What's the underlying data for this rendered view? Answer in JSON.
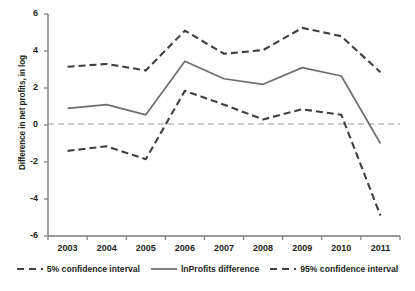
{
  "chart_data": {
    "type": "line",
    "title": "",
    "xlabel": "",
    "ylabel": "Difference in net profits, in log",
    "categories": [
      "2003",
      "2004",
      "2005",
      "2006",
      "2007",
      "2008",
      "2009",
      "2010",
      "2011"
    ],
    "x": [
      2003,
      2004,
      2005,
      2006,
      2007,
      2008,
      2009,
      2010,
      2011
    ],
    "ylim": [
      -6,
      6
    ],
    "yticks": [
      6,
      4,
      2,
      0,
      -2,
      -4,
      -6
    ],
    "ytick_labels": [
      "6",
      "4",
      "2",
      "0",
      "-2",
      "-4",
      "-6"
    ],
    "grid": false,
    "zero_line": 0,
    "legend_position": "bottom",
    "series": [
      {
        "name": "5% confidence interval",
        "style": "dashed",
        "color": "#3f3f3f",
        "values": [
          3.15,
          3.3,
          2.95,
          5.1,
          3.85,
          4.05,
          5.25,
          4.8,
          2.85
        ]
      },
      {
        "name": "lnProfits difference",
        "style": "solid",
        "color": "#6e6e6e",
        "values": [
          0.9,
          1.1,
          0.55,
          3.45,
          2.5,
          2.2,
          3.1,
          2.65,
          -1.0
        ]
      },
      {
        "name": "95% confidence interval",
        "style": "dashed",
        "color": "#3f3f3f",
        "values": [
          -1.4,
          -1.15,
          -1.85,
          1.85,
          1.1,
          0.3,
          0.85,
          0.55,
          -4.9
        ]
      }
    ]
  },
  "axis": {
    "y_title": "Difference in net profits, in log"
  },
  "legend": {
    "items": [
      {
        "label": "5% confidence interval"
      },
      {
        "label": "lnProfits difference"
      },
      {
        "label": "95% confidence interval"
      }
    ]
  },
  "colors": {
    "axis": "#7a7a7a",
    "solid_line": "#6e6e6e",
    "dashed_line": "#3f3f3f",
    "zero_line": "#9a9a9a",
    "text": "#231f20",
    "background": "#ffffff"
  }
}
